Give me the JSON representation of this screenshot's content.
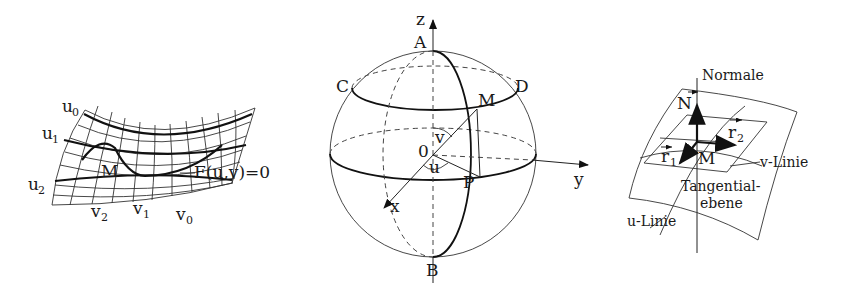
{
  "figure1": {
    "title": "Gaussian coordinates on a surface",
    "labels": {
      "u0": "u",
      "u0_sub": "0",
      "u1": "u",
      "u1_sub": "1",
      "u2": "u",
      "u2_sub": "2",
      "v2": "v",
      "v2_sub": "2",
      "v1": "v",
      "v1_sub": "1",
      "v0": "v",
      "v0_sub": "0",
      "point": "M",
      "curve_eq": "F(u,v)=0"
    }
  },
  "figure2": {
    "title": "Sphere with spherical coordinates",
    "labels": {
      "z_axis": "z",
      "y_axis": "y",
      "x_axis": "x",
      "north": "A",
      "south": "B",
      "c": "C",
      "d": "D",
      "m": "M",
      "p": "P",
      "origin": "0",
      "angle_v": "v",
      "angle_u": "u"
    }
  },
  "figure3": {
    "title": "Tangent plane and normal",
    "labels": {
      "normal": "Normale",
      "n_vec": "N",
      "r2": "r",
      "r2_sub": "2",
      "r1": "r",
      "r1_sub": "1",
      "point": "M",
      "v_line": "v-Linie",
      "u_line": "u-Linie",
      "tangent_plane_1": "Tangential-",
      "tangent_plane_2": "ebene"
    }
  },
  "colors": {
    "ink": "#111111",
    "background": "#ffffff"
  }
}
